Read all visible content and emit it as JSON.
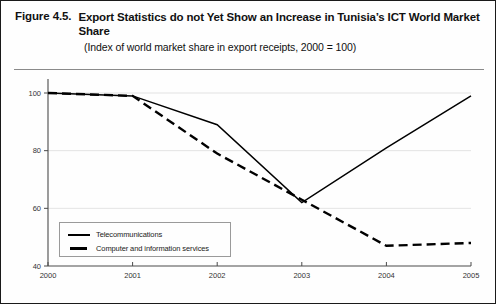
{
  "figure": {
    "label": "Figure 4.5.",
    "title": "Export Statistics do not Yet Show an Increase in Tunisia’s ICT World Market Share",
    "subtitle": "(Index of world market share in export receipts, 2000 = 100)"
  },
  "chart_data": {
    "type": "line",
    "title": "Export Statistics do not Yet Show an Increase in Tunisia’s ICT World Market Share",
    "subtitle": "(Index of world market share in export receipts, 2000 = 100)",
    "xlabel": "",
    "ylabel": "",
    "x": [
      2000,
      2001,
      2002,
      2003,
      2004,
      2005
    ],
    "categories": [
      "2000",
      "2001",
      "2002",
      "2003",
      "2004",
      "2005"
    ],
    "xlim": [
      2000,
      2005
    ],
    "ylim": [
      40,
      100
    ],
    "yticks": [
      40,
      60,
      80,
      100
    ],
    "ytick_labels": [
      "40",
      "60",
      "80",
      "100"
    ],
    "xticks": [
      2000,
      2001,
      2002,
      2003,
      2004,
      2005
    ],
    "xtick_labels": [
      "2000",
      "2001",
      "2002",
      "2003",
      "2004",
      "2005"
    ],
    "grid": true,
    "legend_position": "lower-left",
    "series": [
      {
        "name": "Telecommunications",
        "style": "solid",
        "color": "#000000",
        "values": [
          100,
          99,
          89,
          62,
          81,
          99
        ]
      },
      {
        "name": "Computer and information services",
        "style": "dashed",
        "color": "#000000",
        "values": [
          100,
          99,
          79,
          63,
          47,
          48
        ]
      }
    ]
  },
  "legend": {
    "items": [
      {
        "label": "Telecommunications",
        "style": "solid"
      },
      {
        "label": "Computer and information services",
        "style": "dashed"
      }
    ]
  }
}
